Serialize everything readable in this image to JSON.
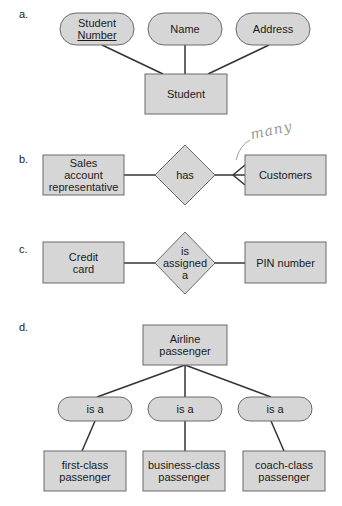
{
  "colors": {
    "fill": "#d6d6d6",
    "stroke": "#6a6a6a",
    "line": "#333333",
    "annotation": "#9a9a9a"
  },
  "diagrams": {
    "a": {
      "label": "a.",
      "entity": "Student",
      "attributes": [
        {
          "line1": "Student",
          "line2": "Number",
          "key": true
        },
        {
          "line1": "Name"
        },
        {
          "line1": "Address"
        }
      ]
    },
    "b": {
      "label": "b.",
      "entity_left": {
        "line1": "Sales",
        "line2": "account",
        "line3": "representative"
      },
      "relationship": "has",
      "entity_right": "Customers",
      "cardinality_annotation": "many"
    },
    "c": {
      "label": "c.",
      "entity_left": {
        "line1": "Credit",
        "line2": "card"
      },
      "relationship": {
        "line1": "is",
        "line2": "assigned",
        "line3": "a"
      },
      "entity_right": "PIN number"
    },
    "d": {
      "label": "d.",
      "supertype": {
        "line1": "Airline",
        "line2": "passenger"
      },
      "relationships": [
        "is a",
        "is a",
        "is a"
      ],
      "subtypes": [
        {
          "line1": "first-class",
          "line2": "passenger"
        },
        {
          "line1": "business-class",
          "line2": "passenger"
        },
        {
          "line1": "coach-class",
          "line2": "passenger"
        }
      ]
    }
  }
}
